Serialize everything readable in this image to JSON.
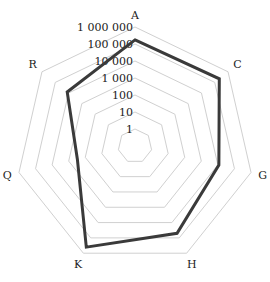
{
  "chart_data": {
    "type": "radar",
    "title": "",
    "scale": "log10",
    "axis_tick_labels": [
      "1",
      "10",
      "100",
      "1 000",
      "10 000",
      "100 000",
      "1 000 000"
    ],
    "categories": [
      "A",
      "C",
      "G",
      "H",
      "K",
      "Q",
      "R"
    ],
    "series": [
      {
        "name": "Series 1",
        "values": [
          175000,
          220000,
          11500,
          50000,
          400000,
          300,
          12600
        ],
        "color": "#3a3a3a"
      }
    ],
    "ylim": [
      1,
      1000000
    ],
    "grid": true,
    "legend": "none"
  },
  "colors": {
    "grid": "#d0d0d0",
    "series": "#3a3a3a",
    "text": "#222222"
  }
}
